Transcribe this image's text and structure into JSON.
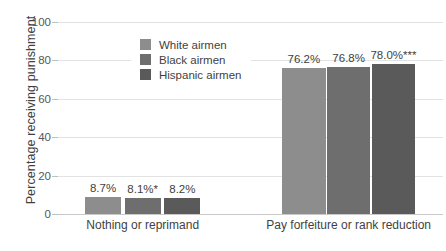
{
  "chart_data": {
    "type": "bar",
    "title": "",
    "xlabel": "",
    "ylabel": "Percentage receiving punishment",
    "ylim": [
      0,
      100
    ],
    "yticks": [
      "0",
      "20",
      "40",
      "60",
      "80",
      "100"
    ],
    "ytick_values": [
      0,
      20,
      40,
      60,
      80,
      100
    ],
    "grid": "horizontal",
    "legend_position": "upper-center-left",
    "categories": [
      "Nothing or reprimand",
      "Pay forfeiture or rank reduction"
    ],
    "series": [
      {
        "name": "White airmen",
        "color": "#8d8d8d",
        "values": [
          8.7,
          76.2
        ],
        "labels": [
          "8.7%",
          "76.2%"
        ]
      },
      {
        "name": "Black airmen",
        "color": "#6e6e6e",
        "values": [
          8.1,
          76.8
        ],
        "labels": [
          "8.1%*",
          "76.8%"
        ]
      },
      {
        "name": "Hispanic airmen",
        "color": "#5a5a5a",
        "values": [
          8.2,
          78.0
        ],
        "labels": [
          "8.2%",
          "78.0%***"
        ]
      }
    ]
  },
  "legend": {
    "items": [
      {
        "label": "White airmen",
        "color": "#8d8d8d"
      },
      {
        "label": "Black airmen",
        "color": "#6e6e6e"
      },
      {
        "label": "Hispanic airmen",
        "color": "#5a5a5a"
      }
    ]
  },
  "axis": {
    "y_title": "Percentage receiving punishment"
  }
}
